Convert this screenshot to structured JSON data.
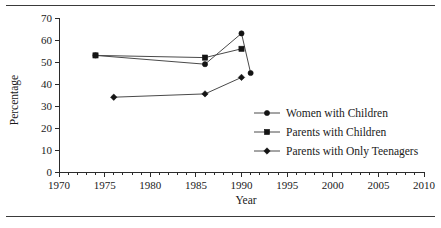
{
  "chart_data": {
    "type": "line",
    "title": "",
    "xlabel": "Year",
    "ylabel": "Percentage",
    "xlim": [
      1970,
      2010
    ],
    "ylim": [
      0,
      70
    ],
    "xticks": [
      1970,
      1975,
      1980,
      1985,
      1990,
      1995,
      2000,
      2005,
      2010
    ],
    "xtick_labels": [
      "1970",
      "1975",
      "1980",
      "1985",
      "1990",
      "1995",
      "2000",
      "2005",
      "2010"
    ],
    "xminor_step": 1,
    "yticks": [
      0,
      10,
      20,
      30,
      40,
      50,
      60,
      70
    ],
    "ytick_labels": [
      "0",
      "10",
      "20",
      "30",
      "40",
      "50",
      "60",
      "70"
    ],
    "grid": false,
    "legend_position": "center-right",
    "series": [
      {
        "name": "Women with Children",
        "marker": "circle",
        "x": [
          1974,
          1986,
          1990,
          1991
        ],
        "y": [
          53,
          49,
          63,
          45
        ]
      },
      {
        "name": "Parents with Children",
        "marker": "square",
        "x": [
          1974,
          1986,
          1990
        ],
        "y": [
          53,
          52,
          56
        ]
      },
      {
        "name": "Parents with Only Teenagers",
        "marker": "diamond",
        "x": [
          1976,
          1986,
          1990
        ],
        "y": [
          34,
          35.5,
          43
        ]
      }
    ]
  },
  "legend": {
    "items": [
      {
        "label": "Women with Children",
        "marker": "circle"
      },
      {
        "label": "Parents with Children",
        "marker": "square"
      },
      {
        "label": "Parents with Only Teenagers",
        "marker": "diamond"
      }
    ]
  },
  "colors": {
    "line": "#4a4a4a",
    "marker": "#141414",
    "axis": "#2b2b2b",
    "text": "#1a1a1a",
    "rule": "#3a3a3a",
    "background": "#ffffff"
  }
}
